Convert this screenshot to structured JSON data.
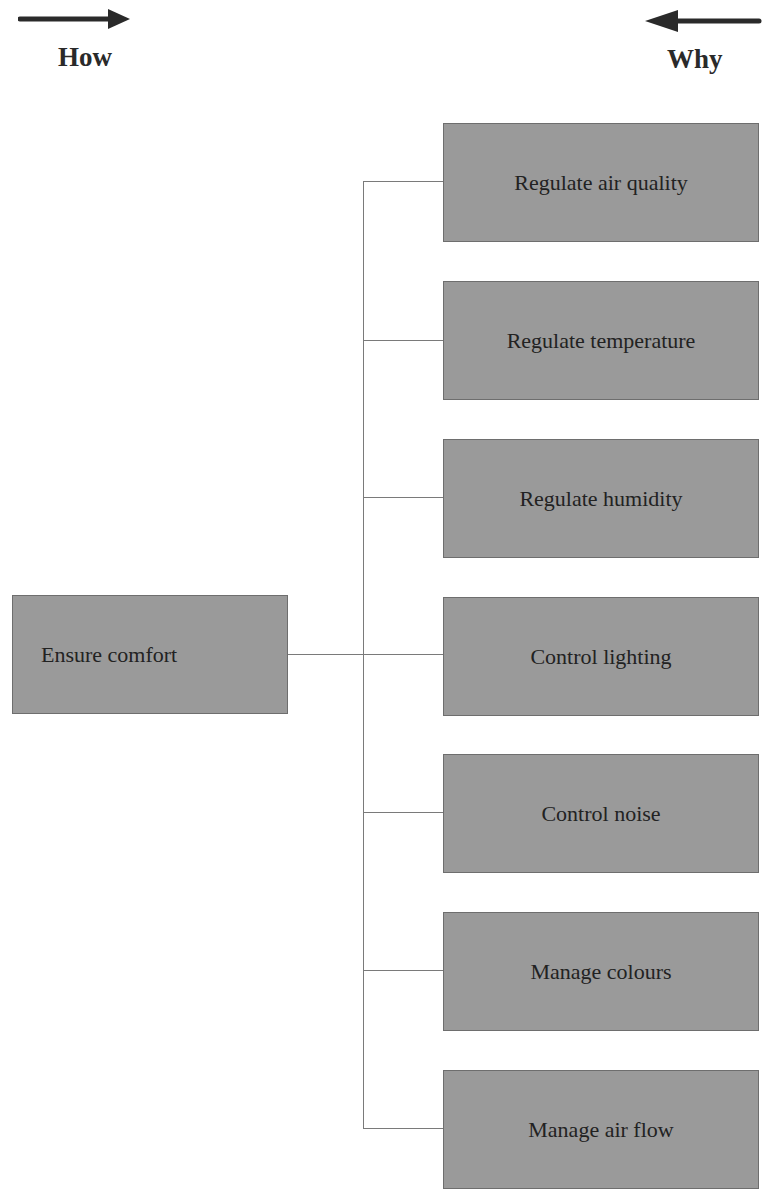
{
  "legend": {
    "how": {
      "label": "How",
      "direction": "right"
    },
    "why": {
      "label": "Why",
      "direction": "left"
    }
  },
  "root": {
    "label": "Ensure comfort"
  },
  "children": [
    {
      "label": "Regulate air quality"
    },
    {
      "label": "Regulate temperature"
    },
    {
      "label": "Regulate humidity"
    },
    {
      "label": "Control lighting"
    },
    {
      "label": "Control noise"
    },
    {
      "label": "Manage colours"
    },
    {
      "label": "Manage air flow"
    }
  ],
  "colors": {
    "box_fill": "#9a9a9a",
    "box_border": "#6e6e6e",
    "connector": "#7a7a7a",
    "arrow": "#2a2a2a"
  }
}
